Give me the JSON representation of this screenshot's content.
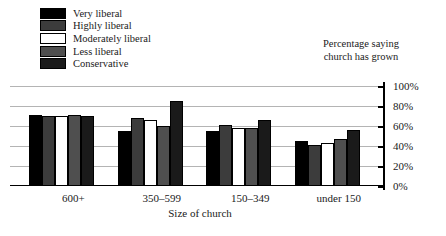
{
  "chart_data": {
    "type": "bar",
    "title": "Percentage saying church has grown",
    "title_line1": "Percentage saying",
    "title_line2": "church has grown",
    "xlabel": "Size of church",
    "ylabel": "",
    "ylim": [
      0,
      100
    ],
    "grid": true,
    "legend_position": "top-left",
    "yticks": [
      {
        "value": 100,
        "label": "100%"
      },
      {
        "value": 80,
        "label": "80%"
      },
      {
        "value": 60,
        "label": "60%"
      },
      {
        "value": 40,
        "label": "40%"
      },
      {
        "value": 20,
        "label": "20%"
      },
      {
        "value": 0,
        "label": "0%"
      }
    ],
    "categories": [
      "600+",
      "350–599",
      "150–349",
      "under 150"
    ],
    "series": [
      {
        "name": "Very liberal",
        "color": "#000000",
        "values": [
          71,
          55,
          55,
          45
        ]
      },
      {
        "name": "Highly liberal",
        "color": "#3c3c3c",
        "values": [
          70,
          68,
          61,
          41
        ]
      },
      {
        "name": "Moderately liberal",
        "color": "#ffffff",
        "values": [
          70,
          66,
          58,
          43
        ]
      },
      {
        "name": "Less liberal",
        "color": "#4f4f4f",
        "values": [
          71,
          60,
          58,
          47
        ]
      },
      {
        "name": "Conservative",
        "color": "#1a1a1a",
        "values": [
          70,
          85,
          66,
          56
        ]
      }
    ]
  }
}
